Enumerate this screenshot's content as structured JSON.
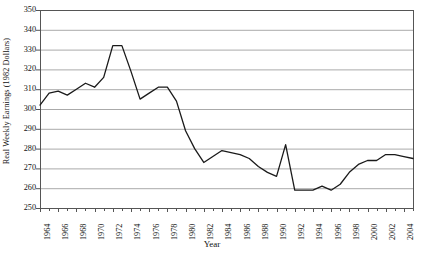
{
  "chart_data": {
    "type": "line",
    "title": "",
    "xlabel": "Year",
    "ylabel": "Real Weekly Earnings (1982 Dollars)",
    "ylim": [
      250,
      350
    ],
    "ytick_step": 10,
    "yticks": [
      250,
      260,
      270,
      280,
      290,
      300,
      310,
      320,
      330,
      340,
      350
    ],
    "xlim": [
      1964,
      2005
    ],
    "xticks": [
      1964,
      1966,
      1968,
      1970,
      1972,
      1974,
      1976,
      1978,
      1980,
      1982,
      1984,
      1986,
      1988,
      1990,
      1992,
      1994,
      1996,
      1998,
      2000,
      2002,
      2004
    ],
    "xtick_labels": [
      "1964",
      "1966",
      "1968",
      "1970",
      "1972",
      "1974",
      "1976",
      "1978",
      "1980",
      "1982",
      "1984",
      "1986",
      "1988",
      "1990",
      "1992",
      "1994",
      "1996",
      "1998",
      "2000",
      "2002",
      "2004"
    ],
    "grid": "horizontal",
    "legend": "none",
    "line_color": "#1a1a1a",
    "grid_color": "#aaaaaa",
    "axis_color": "#555555",
    "x": [
      1964,
      1965,
      1966,
      1967,
      1968,
      1969,
      1970,
      1971,
      1972,
      1973,
      1974,
      1975,
      1976,
      1977,
      1978,
      1979,
      1980,
      1981,
      1982,
      1983,
      1984,
      1985,
      1986,
      1987,
      1988,
      1989,
      1990,
      1991,
      1992,
      1993,
      1994,
      1995,
      1996,
      1997,
      1998,
      1999,
      2000,
      2001,
      2002,
      2003,
      2004,
      2005
    ],
    "values": [
      302,
      308,
      309,
      307,
      310,
      313,
      311,
      316,
      332,
      332,
      319,
      305,
      308,
      311,
      311,
      304,
      289,
      280,
      273,
      276,
      279,
      278,
      277,
      275,
      271,
      268,
      266,
      282,
      259,
      259,
      259,
      261,
      259,
      262,
      268,
      272,
      274,
      274,
      277,
      277,
      276,
      275
    ],
    "series_name": "Real Weekly Earnings"
  }
}
